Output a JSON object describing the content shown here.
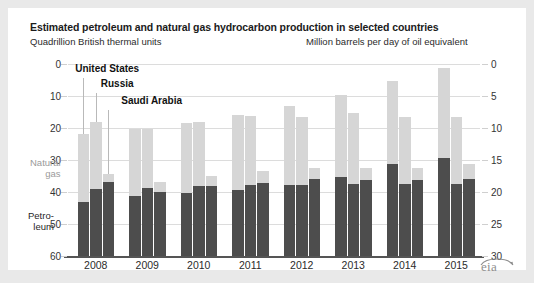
{
  "header": {
    "title": "Estimated petroleum and natural gas hydrocarbon production in selected countries",
    "left_unit": "Quadrillion British thermal units",
    "right_unit": "Million barrels per day of oil equivalent"
  },
  "annotations": {
    "united_states": "United States",
    "russia": "Russia",
    "saudi_arabia": "Saudi Arabia",
    "natural_gas_line1": "Natural",
    "natural_gas_line2": "gas",
    "petroleum_line1": "Petro-",
    "petroleum_line2": "leum"
  },
  "logo": {
    "text": "eia"
  },
  "axes": {
    "left_ticks": [
      "60",
      "50",
      "40",
      "30",
      "20",
      "10",
      "0"
    ],
    "right_ticks": [
      "30",
      "25",
      "20",
      "15",
      "10",
      "5",
      "0"
    ]
  },
  "colors": {
    "natural_gas": "#d6d6d6",
    "petroleum": "#4d4d4d",
    "gridline": "#dcdcdc",
    "baseline": "#555555",
    "page_background": "#e9e9e9",
    "chart_background": "#ffffff",
    "leader_line": "#b9b9b9",
    "logo_gray": "#8e8e8e"
  },
  "chart_data": {
    "type": "bar",
    "subtype": "stacked-grouped",
    "title": "Estimated petroleum and natural gas hydrocarbon production in selected countries",
    "xlabel": "",
    "ylabel": "Quadrillion British thermal units",
    "ylabel_secondary": "Million barrels per day of oil equivalent",
    "ylim": [
      0,
      60
    ],
    "ylim_secondary": [
      0,
      30
    ],
    "yticks": [
      0,
      10,
      20,
      30,
      40,
      50,
      60
    ],
    "yticks_secondary": [
      0,
      5,
      10,
      15,
      20,
      25,
      30
    ],
    "grid": true,
    "legend_position": "in-plot-left",
    "categories": [
      "2008",
      "2009",
      "2010",
      "2011",
      "2012",
      "2013",
      "2014",
      "2015"
    ],
    "groups": [
      "United States",
      "Russia",
      "Saudi Arabia"
    ],
    "stack_order": [
      "Petroleum",
      "Natural gas"
    ],
    "series": [
      {
        "name": "Petroleum",
        "color": "#4d4d4d",
        "data": {
          "United States": [
            17.0,
            18.6,
            19.8,
            20.5,
            22.3,
            24.6,
            28.6,
            30.6
          ],
          "Russia": [
            21.0,
            21.3,
            21.8,
            22.1,
            22.3,
            22.6,
            22.4,
            22.6
          ],
          "Saudi Arabia": [
            23.0,
            20.0,
            21.8,
            22.8,
            24.0,
            23.6,
            23.6,
            24.0
          ]
        }
      },
      {
        "name": "Natural gas",
        "color": "#d6d6d6",
        "data": {
          "United States": [
            21.0,
            21.2,
            21.7,
            23.5,
            24.6,
            25.8,
            26.2,
            28.3
          ],
          "Russia": [
            21.0,
            18.5,
            20.2,
            21.8,
            21.0,
            22.0,
            21.1,
            20.7
          ],
          "Saudi Arabia": [
            2.5,
            3.0,
            3.1,
            3.7,
            3.6,
            4.0,
            3.9,
            4.6
          ]
        }
      }
    ],
    "totals": {
      "United States": [
        38.0,
        39.8,
        41.5,
        44.0,
        46.9,
        50.4,
        54.8,
        58.9
      ],
      "Russia": [
        42.0,
        39.8,
        42.0,
        43.9,
        43.3,
        44.6,
        43.5,
        43.3
      ],
      "Saudi Arabia": [
        25.5,
        23.0,
        24.9,
        26.5,
        27.6,
        27.6,
        27.5,
        28.6
      ]
    }
  }
}
